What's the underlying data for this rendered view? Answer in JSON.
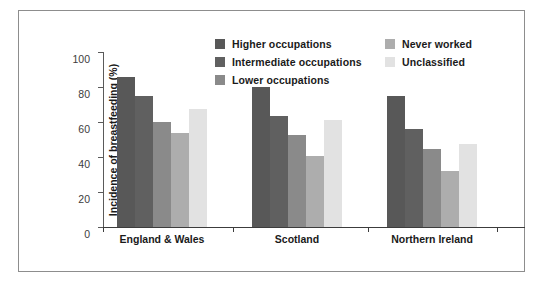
{
  "chart_data": {
    "type": "bar",
    "title": "",
    "xlabel": "",
    "ylabel": "Incidence of breastfeeding (%)",
    "ylim": [
      0,
      100
    ],
    "yticks": [
      "0",
      "20",
      "40",
      "60",
      "80",
      "100"
    ],
    "grid": false,
    "legend_position": "top-center",
    "categories": [
      "England & Wales",
      "Scotland",
      "Northern Ireland"
    ],
    "series": [
      {
        "name": "Higher occupations",
        "color": "#585858",
        "values": [
          86,
          80,
          75
        ]
      },
      {
        "name": "Intermediate occupations",
        "color": "#606060",
        "values": [
          75,
          63.5,
          56
        ]
      },
      {
        "name": "Lower occupations",
        "color": "#8a8a8a",
        "values": [
          60,
          52.5,
          44.5
        ]
      },
      {
        "name": "Never worked",
        "color": "#adadad",
        "values": [
          53.5,
          40.5,
          32
        ]
      },
      {
        "name": "Unclassified",
        "color": "#e2e2e2",
        "values": [
          67.5,
          61,
          47.5
        ]
      }
    ]
  },
  "legend": {
    "columns": [
      {
        "items": [
          "Higher occupations",
          "Intermediate occupations",
          "Lower occupations"
        ]
      },
      {
        "items": [
          "Never worked",
          "Unclassified"
        ]
      }
    ]
  }
}
